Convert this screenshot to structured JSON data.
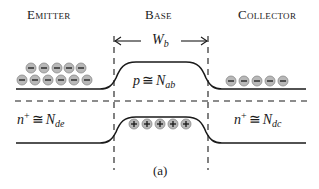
{
  "diagram": {
    "regions": {
      "emitter": {
        "label": "Emitter",
        "doping": {
          "symbol": "n",
          "sup": "+",
          "rel": "≅",
          "N": "N",
          "sub": "de"
        }
      },
      "base": {
        "label": "Base",
        "width_symbol": {
          "W": "W",
          "sub": "b"
        },
        "doping": {
          "symbol": "p",
          "rel": "≅",
          "N": "N",
          "sub": "ab"
        }
      },
      "collector": {
        "label": "Collector",
        "doping": {
          "symbol": "n",
          "sup": "+",
          "rel": "≅",
          "N": "N",
          "sub": "dc"
        }
      }
    },
    "carriers": {
      "emitter_electrons_row1": 5,
      "emitter_electrons_row2": 6,
      "collector_electrons": 5,
      "base_holes": 5,
      "electron_glyph": "⊖",
      "hole_glyph": "⊕"
    },
    "caption": "(a)",
    "colors": {
      "line": "#1a1a1a",
      "carrier_fill": "#b8b8b8",
      "carrier_stroke": "#8a8a8a"
    }
  }
}
